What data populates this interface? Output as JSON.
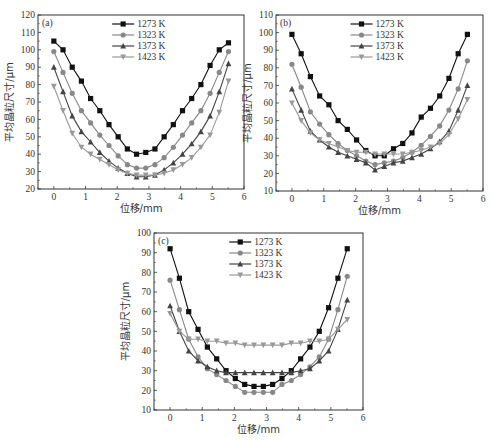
{
  "chart_data": [
    {
      "type": "line",
      "panel_label": "(a)",
      "xlabel": "位移/mm",
      "ylabel": "平均晶粒尺寸/μm",
      "xlim": [
        -0.5,
        6
      ],
      "ylim": [
        20,
        120
      ],
      "xticks": [
        0,
        1,
        2,
        3,
        4,
        5,
        6
      ],
      "yticks": [
        20,
        30,
        40,
        50,
        60,
        70,
        80,
        90,
        100,
        110,
        120
      ],
      "legend_position": "upper center",
      "x": [
        0,
        0.29,
        0.58,
        0.87,
        1.16,
        1.45,
        1.74,
        2.03,
        2.32,
        2.61,
        2.9,
        3.19,
        3.48,
        3.77,
        4.06,
        4.35,
        4.64,
        4.93,
        5.22,
        5.51
      ],
      "series": [
        {
          "name": "1273 K",
          "marker": "square",
          "color": "#111111",
          "values": [
            105,
            100,
            90,
            82,
            72,
            65,
            57,
            50,
            43,
            40,
            41,
            43,
            50,
            57,
            65,
            72,
            80,
            91,
            100,
            104
          ]
        },
        {
          "name": "1323 K",
          "marker": "circle",
          "color": "#888888",
          "values": [
            99,
            87,
            75,
            65,
            58,
            51,
            45,
            39,
            34,
            32,
            32,
            34,
            38,
            44,
            51,
            58,
            65,
            75,
            87,
            99
          ]
        },
        {
          "name": "1373 K",
          "marker": "triangle-up",
          "color": "#444444",
          "values": [
            90,
            76,
            62,
            53,
            47,
            41,
            36,
            32,
            29,
            27,
            27,
            28,
            31,
            35,
            40,
            46,
            53,
            62,
            76,
            92
          ]
        },
        {
          "name": "1423 K",
          "marker": "triangle-down",
          "color": "#999999",
          "values": [
            79,
            65,
            52,
            44,
            40,
            37,
            34,
            31,
            29,
            28,
            28,
            28,
            29,
            31,
            34,
            38,
            44,
            51,
            64,
            82
          ]
        }
      ]
    },
    {
      "type": "line",
      "panel_label": "(b)",
      "xlabel": "位移/mm",
      "ylabel": "平均晶粒尺寸/μm",
      "xlim": [
        -0.5,
        6
      ],
      "ylim": [
        10,
        110
      ],
      "xticks": [
        0,
        1,
        2,
        3,
        4,
        5,
        6
      ],
      "yticks": [
        10,
        20,
        30,
        40,
        50,
        60,
        70,
        80,
        90,
        100,
        110
      ],
      "legend_position": "upper center",
      "x": [
        0,
        0.29,
        0.58,
        0.87,
        1.16,
        1.45,
        1.74,
        2.03,
        2.32,
        2.61,
        2.9,
        3.19,
        3.48,
        3.77,
        4.06,
        4.35,
        4.64,
        4.93,
        5.22,
        5.51
      ],
      "series": [
        {
          "name": "1273 K",
          "marker": "square",
          "color": "#111111",
          "values": [
            99,
            88,
            75,
            64,
            59,
            50,
            45,
            39,
            33,
            30,
            30,
            34,
            37,
            43,
            52,
            57,
            64,
            74,
            88,
            99
          ]
        },
        {
          "name": "1323 K",
          "marker": "circle",
          "color": "#888888",
          "values": [
            82,
            69,
            55,
            48,
            42,
            37,
            33,
            30,
            27,
            25,
            26,
            27,
            29,
            32,
            36,
            41,
            47,
            56,
            68,
            84
          ]
        },
        {
          "name": "1373 K",
          "marker": "triangle-up",
          "color": "#444444",
          "values": [
            68,
            56,
            44,
            39,
            35,
            32,
            30,
            28,
            26,
            22,
            24,
            26,
            27,
            29,
            31,
            34,
            38,
            44,
            56,
            70
          ]
        },
        {
          "name": "1423 K",
          "marker": "triangle-down",
          "color": "#999999",
          "values": [
            60,
            50,
            43,
            39,
            37,
            35,
            33,
            32,
            32,
            31,
            31,
            31,
            31,
            32,
            33,
            35,
            37,
            42,
            51,
            62
          ]
        }
      ]
    },
    {
      "type": "line",
      "panel_label": "(c)",
      "xlabel": "位移/mm",
      "ylabel": "平均晶粒尺寸/μm",
      "xlim": [
        -0.5,
        6
      ],
      "ylim": [
        10,
        100
      ],
      "xticks": [
        0,
        1,
        2,
        3,
        4,
        5,
        6
      ],
      "yticks": [
        10,
        20,
        30,
        40,
        50,
        60,
        70,
        80,
        90,
        100
      ],
      "legend_position": "upper center",
      "x": [
        0,
        0.29,
        0.58,
        0.87,
        1.16,
        1.45,
        1.74,
        2.03,
        2.32,
        2.61,
        2.9,
        3.19,
        3.48,
        3.77,
        4.06,
        4.35,
        4.64,
        4.93,
        5.22,
        5.51
      ],
      "series": [
        {
          "name": "1273 K",
          "marker": "square",
          "color": "#111111",
          "values": [
            92,
            77,
            60,
            51,
            42,
            36,
            30,
            26,
            23,
            22,
            22,
            23,
            26,
            30,
            36,
            42,
            50,
            62,
            77,
            92
          ]
        },
        {
          "name": "1323 K",
          "marker": "circle",
          "color": "#888888",
          "values": [
            76,
            61,
            46,
            37,
            31,
            28,
            25,
            22,
            19,
            19,
            19,
            19,
            23,
            25,
            28,
            32,
            37,
            46,
            61,
            78
          ]
        },
        {
          "name": "1373 K",
          "marker": "triangle-up",
          "color": "#444444",
          "values": [
            63,
            50,
            40,
            35,
            32,
            30,
            29,
            29,
            29,
            29,
            29,
            29,
            29,
            29,
            30,
            31,
            35,
            40,
            51,
            66
          ]
        },
        {
          "name": "1423 K",
          "marker": "triangle-down",
          "color": "#999999",
          "values": [
            59,
            50,
            46,
            46,
            45,
            45,
            44,
            44,
            43,
            43,
            43,
            43,
            43,
            44,
            44,
            45,
            45,
            46,
            51,
            56
          ]
        }
      ]
    }
  ],
  "panels": [
    {
      "id": "a",
      "box": {
        "left": 38,
        "top": 15,
        "right": 244,
        "bottom": 189
      }
    },
    {
      "id": "b",
      "box": {
        "left": 276,
        "top": 15,
        "right": 483,
        "bottom": 191
      }
    },
    {
      "id": "c",
      "box": {
        "left": 154,
        "top": 233,
        "right": 363,
        "bottom": 410
      }
    }
  ]
}
